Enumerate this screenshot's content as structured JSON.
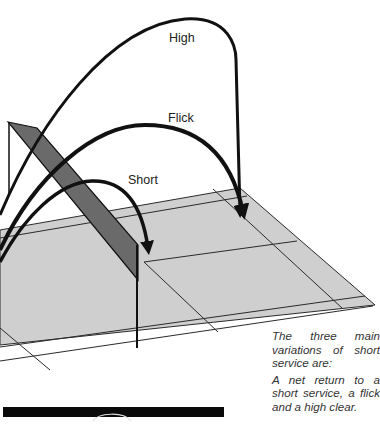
{
  "diagram": {
    "title": "Variations of short service",
    "labels": {
      "high": "High",
      "flick": "Flick",
      "short": "Short"
    },
    "colors": {
      "court_fill": "#cfcfcf",
      "court_lines": "#2a2a2a",
      "net_fill": "#6a6a6a",
      "trajectory": "#111111",
      "background": "#ffffff"
    }
  },
  "caption": {
    "intro": "The three main variations of short service are:",
    "body": "A net return to a short service, a flick and a high clear."
  }
}
